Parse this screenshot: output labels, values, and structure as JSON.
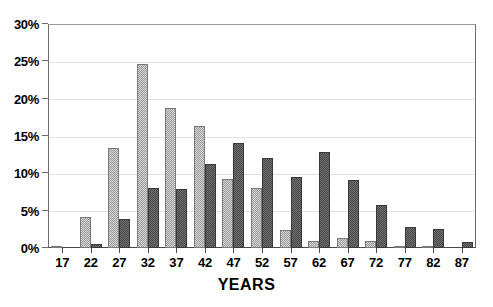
{
  "chart_data": {
    "type": "bar",
    "title": "",
    "subtitle": "",
    "xlabel": "YEARS",
    "ylabel": "",
    "categories": [
      "17",
      "22",
      "27",
      "32",
      "37",
      "42",
      "47",
      "52",
      "57",
      "62",
      "67",
      "72",
      "77",
      "82",
      "87"
    ],
    "ytick_labels": [
      "0%",
      "5%",
      "10%",
      "15%",
      "20%",
      "25%",
      "30%"
    ],
    "ytick_values": [
      0,
      5,
      10,
      15,
      20,
      25,
      30
    ],
    "ylim": [
      0,
      30
    ],
    "grid": true,
    "legend": "none",
    "value_suffix": "%",
    "series": [
      {
        "name": "series-light",
        "style": "light-hatched",
        "color": "#b6b6b6",
        "values": [
          0.2,
          4.2,
          13.4,
          24.7,
          18.8,
          16.3,
          9.3,
          8.1,
          2.4,
          1.0,
          1.3,
          0.9,
          0.2,
          0.1,
          0.0
        ]
      },
      {
        "name": "series-dark",
        "style": "dark-hatched",
        "color": "#5e5e5e",
        "values": [
          0.0,
          0.5,
          3.9,
          8.1,
          7.9,
          11.3,
          14.0,
          12.0,
          9.5,
          12.9,
          9.1,
          5.8,
          2.8,
          2.5,
          0.8
        ]
      }
    ]
  }
}
